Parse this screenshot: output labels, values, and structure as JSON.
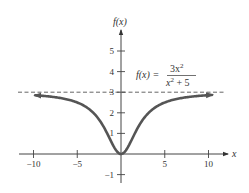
{
  "chart_data": {
    "type": "line",
    "title": "",
    "function": "f(x) = 3x^2 / (x^2 + 5)",
    "formula_label": {
      "lhs": "f(x) =",
      "numerator": "3x",
      "numerator_exp": "2",
      "denominator": "x",
      "denominator_exp": "2",
      "denominator_tail": " + 5"
    },
    "xlabel": "x",
    "ylabel": "f(x)",
    "xlim": [
      -11.5,
      12
    ],
    "ylim": [
      -1.4,
      5.9
    ],
    "x_ticks": [
      -10,
      -5,
      5,
      10
    ],
    "x_tick_labels": [
      "−10",
      "−5",
      "5",
      "10"
    ],
    "y_ticks": [
      -1,
      1,
      2,
      3,
      4,
      5
    ],
    "y_tick_labels": [
      "−1",
      "1",
      "2",
      "3",
      "4",
      "5"
    ],
    "asymptote": {
      "type": "horizontal",
      "y": 3,
      "style": "dashed"
    },
    "curve_domain": [
      -9.8,
      10.4
    ],
    "sample_points": [
      {
        "x": -10,
        "y": 2.857
      },
      {
        "x": -5,
        "y": 2.5
      },
      {
        "x": -2,
        "y": 1.333
      },
      {
        "x": -1,
        "y": 0.5
      },
      {
        "x": 0,
        "y": 0
      },
      {
        "x": 1,
        "y": 0.5
      },
      {
        "x": 2,
        "y": 1.333
      },
      {
        "x": 5,
        "y": 2.5
      },
      {
        "x": 10,
        "y": 2.857
      }
    ],
    "grid": false,
    "legend": "none",
    "colors": {
      "curve": "#555555",
      "axes": "#444444",
      "asymptote": "#555555"
    }
  }
}
